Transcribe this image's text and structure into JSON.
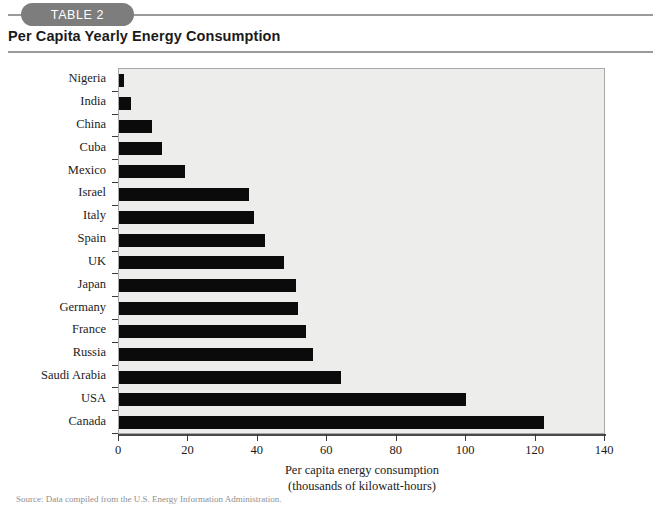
{
  "header": {
    "pill_label": "TABLE 2",
    "title": "Per Capita Yearly Energy Consumption"
  },
  "source_note": "Source: Data compiled from the U.S. Energy Information Administration.",
  "chart_data": {
    "type": "bar",
    "orientation": "horizontal",
    "title": "Per Capita Yearly Energy Consumption",
    "xlabel": "Per capita energy consumption",
    "xlabel_line2": "(thousands of kilowatt-hours)",
    "ylabel": "",
    "xlim": [
      0,
      140
    ],
    "xticks": [
      0,
      20,
      40,
      60,
      80,
      100,
      120,
      140
    ],
    "xtick_labels": [
      "0",
      "20",
      "40",
      "60",
      "80",
      "100",
      "120",
      "140"
    ],
    "grid": false,
    "legend": "none",
    "bar_color": "#0b0b0b",
    "plot_background": "#ededeb",
    "categories": [
      "Nigeria",
      "India",
      "China",
      "Cuba",
      "Mexico",
      "Israel",
      "Italy",
      "Spain",
      "UK",
      "Japan",
      "Germany",
      "France",
      "Russia",
      "Saudi Arabia",
      "USA",
      "Canada"
    ],
    "values": [
      1.5,
      3.5,
      9.5,
      12.5,
      19,
      37.5,
      39,
      42,
      47.5,
      51,
      51.5,
      54,
      56,
      64,
      100,
      122.5
    ],
    "units": "thousands of kilowatt-hours"
  }
}
